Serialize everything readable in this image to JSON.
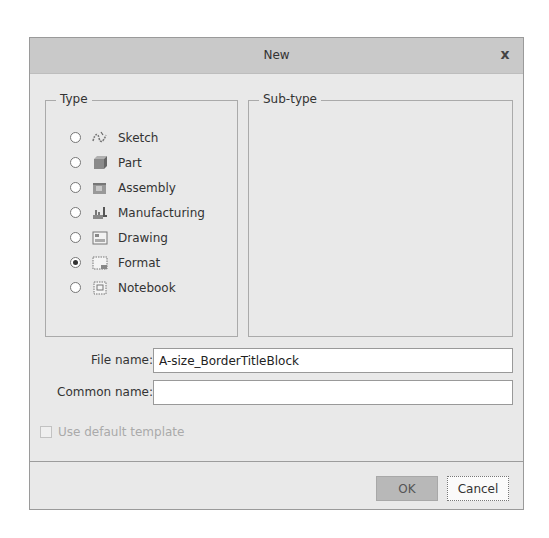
{
  "dialog": {
    "title": "New",
    "close_label": "x"
  },
  "type_group": {
    "legend": "Type",
    "items": [
      {
        "label": "Sketch",
        "icon": "sketch-icon",
        "selected": false
      },
      {
        "label": "Part",
        "icon": "part-icon",
        "selected": false
      },
      {
        "label": "Assembly",
        "icon": "assembly-icon",
        "selected": false
      },
      {
        "label": "Manufacturing",
        "icon": "manufacturing-icon",
        "selected": false
      },
      {
        "label": "Drawing",
        "icon": "drawing-icon",
        "selected": false
      },
      {
        "label": "Format",
        "icon": "format-icon",
        "selected": true
      },
      {
        "label": "Notebook",
        "icon": "notebook-icon",
        "selected": false
      }
    ]
  },
  "subtype_group": {
    "legend": "Sub-type"
  },
  "fields": {
    "file_name_label": "File name:",
    "file_name_value": "A-size_BorderTitleBlock",
    "common_name_label": "Common name:",
    "common_name_value": ""
  },
  "options": {
    "use_default_template_label": "Use default template",
    "use_default_template_checked": false,
    "use_default_template_enabled": false
  },
  "buttons": {
    "ok_label": "OK",
    "cancel_label": "Cancel"
  }
}
